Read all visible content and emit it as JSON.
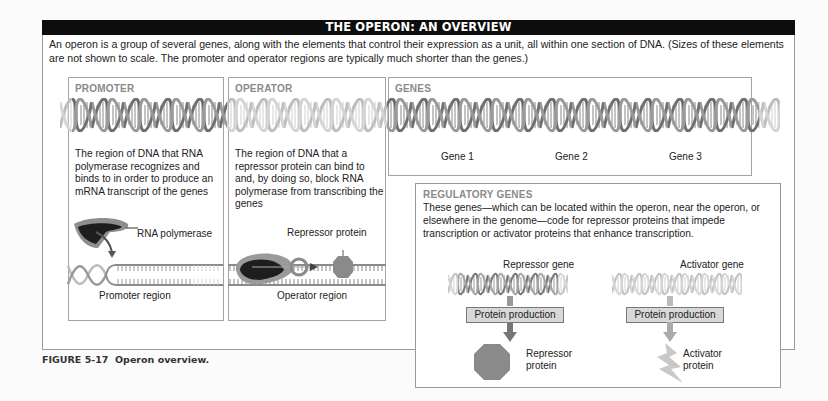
{
  "title": "THE OPERON: AN OVERVIEW",
  "intro": "An operon is a group of several genes, along with the elements that control their expression as a unit, all within one section of DNA. (Sizes of these elements are not shown to scale. The promoter and operator regions are typically much shorter than the genes.)",
  "panels": {
    "promoter": {
      "label": "PROMOTER",
      "description": "The region of DNA that RNA polymerase recognizes and binds to in order to produce an mRNA transcript of the genes",
      "enzyme_label": "RNA polymerase",
      "region_label": "Promoter region"
    },
    "operator": {
      "label": "OPERATOR",
      "description": "The region of DNA that a repressor protein can bind to and, by doing so, block RNA polymerase from transcribing the genes",
      "protein_label": "Repressor protein",
      "region_label": "Operator region"
    },
    "genes": {
      "label": "GENES",
      "items": [
        "Gene 1",
        "Gene 2",
        "Gene 3"
      ]
    },
    "regulatory": {
      "label": "REGULATORY GENES",
      "description": "These genes—which can be located within the operon, near the operon, or elsewhere in the genome—code for repressor proteins that impede transcription or activator proteins that enhance transcription.",
      "repressor": {
        "gene_label": "Repressor gene",
        "process_label": "Protein production",
        "product_label_1": "Repressor",
        "product_label_2": "protein"
      },
      "activator": {
        "gene_label": "Activator gene",
        "process_label": "Protein production",
        "product_label_1": "Activator",
        "product_label_2": "protein"
      }
    }
  },
  "caption": {
    "figure_number": "FIGURE 5-17",
    "text": "Operon overview."
  },
  "colors": {
    "title_bar": "#0d0d0d",
    "dna_dark": "#7a7a7a",
    "dna_light": "#c4c4c4",
    "repressor_protein": "#8a8a8a",
    "activator_protein": "#c8c8c8",
    "rna_polymerase_dark": "#1e1e1e",
    "rna_polymerase_light": "#8e8e8e",
    "panel_label": "#8a8a8a"
  }
}
